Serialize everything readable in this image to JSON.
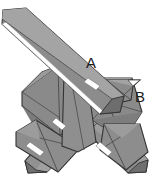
{
  "figure": {
    "kind": "geometric-solid-diagram",
    "background_color": "#ffffff",
    "palette": {
      "face_light": "#a8a8a8",
      "face_mid": "#8e8e8e",
      "face_base": "#898989",
      "face_dark": "#6f6f6f",
      "face_darker": "#5c5c5c",
      "outline": "#333333",
      "seam": "#4a4a4a",
      "highlight": "#ffffff",
      "label_color": "#1c1c1c"
    },
    "canvas": {
      "width": 154,
      "height": 184
    },
    "labels": [
      {
        "id": "A",
        "text": "A",
        "x": 86,
        "y": 55,
        "font_size": 15,
        "points_to_x": 99,
        "points_to_y": 76
      },
      {
        "id": "B",
        "text": "B",
        "x": 135,
        "y": 89,
        "font_size": 15,
        "points_to_x": 133,
        "points_to_y": 86
      }
    ],
    "parts": [
      {
        "name": "long-diagonal-bar-upper-left",
        "note": "Longest bar, runs from top-left corner down to lower-right through the centre."
      },
      {
        "name": "left-chevron-bar",
        "note": "Bent chevron element on the middle-left with internal fold seams."
      },
      {
        "name": "right-arrow-wing",
        "note": "Small triangular wing at the right edge near label B."
      },
      {
        "name": "bottom-left-leg",
        "note": "Lower-left leg of the X, tapering to a point near the bottom-left."
      },
      {
        "name": "bottom-right-leg",
        "note": "Lower-right leg of the X, tapering to a point near the bottom-right."
      },
      {
        "name": "central-vertical-bar",
        "note": "Upright bar passing through the centre of the assembly."
      }
    ]
  }
}
